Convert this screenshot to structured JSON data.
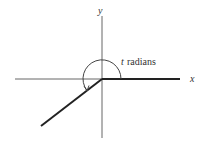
{
  "diagram": {
    "title": "",
    "axes": {
      "x_label": "x",
      "y_label": "y"
    },
    "angle": {
      "variable": "t",
      "unit_text": "radians",
      "label": "t radians"
    },
    "colors": {
      "axis": "#555555",
      "ray": "#222222",
      "background": "#ffffff"
    }
  }
}
